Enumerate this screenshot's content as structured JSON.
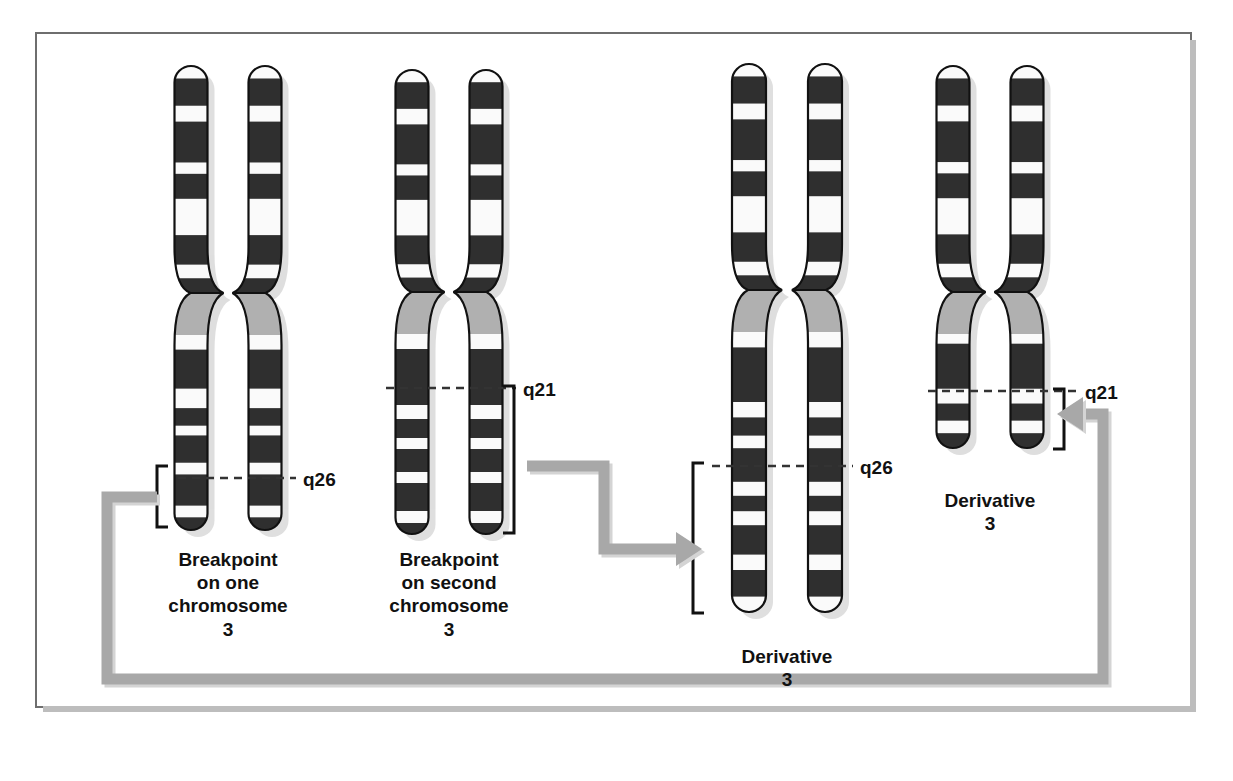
{
  "figure": {
    "background_color": "#ffffff",
    "border_color": "#6e6e6e",
    "shadow_color": "#bdbdbd"
  },
  "colors": {
    "band_dark": "#2f2f2f",
    "band_light": "#fafafa",
    "centromere_gray": "#b0b0b0",
    "outline": "#111111",
    "drop_shadow": "#c4c4c4",
    "connector_gray": "#a8a8a8",
    "bracket_black": "#111111",
    "dash_color": "#333333"
  },
  "groups": [
    {
      "id": "chromosome-pair-1",
      "caption": "Breakpoint\non one\nchromosome\n3",
      "caption_x": 228,
      "caption_y": 548,
      "band_label": "q26",
      "band_label_x": 303,
      "band_label_y": 468,
      "dash_y": 478,
      "dash_x1": 178,
      "dash_x2": 296,
      "bracket": {
        "x": 157,
        "y_top": 466,
        "y_bottom": 527
      },
      "center_x": 228,
      "top_y": 66,
      "bottom_y": 530,
      "centromere_y": 293,
      "chromatid_offset": 37,
      "width": 33,
      "p_bands": [
        [
          0.0,
          0.055,
          "light"
        ],
        [
          0.055,
          0.175,
          "dark"
        ],
        [
          0.175,
          0.245,
          "light"
        ],
        [
          0.245,
          0.425,
          "dark"
        ],
        [
          0.425,
          0.475,
          "light"
        ],
        [
          0.475,
          0.585,
          "dark"
        ],
        [
          0.585,
          0.745,
          "light"
        ],
        [
          0.745,
          0.875,
          "dark"
        ],
        [
          0.875,
          0.935,
          "light"
        ],
        [
          0.935,
          1.0,
          "dark"
        ]
      ],
      "q_bands": [
        [
          0.0,
          0.075,
          "light"
        ],
        [
          0.075,
          0.275,
          "dark"
        ],
        [
          0.275,
          0.375,
          "light"
        ],
        [
          0.375,
          0.465,
          "dark"
        ],
        [
          0.465,
          0.515,
          "light"
        ],
        [
          0.515,
          0.655,
          "dark"
        ],
        [
          0.655,
          0.715,
          "light"
        ],
        [
          0.715,
          0.875,
          "dark"
        ],
        [
          0.875,
          0.935,
          "light"
        ],
        [
          0.935,
          1.0,
          "dark"
        ]
      ]
    },
    {
      "id": "chromosome-pair-2",
      "caption": "Breakpoint\non second\nchromosome\n3",
      "caption_x": 449,
      "caption_y": 548,
      "band_label": "q21",
      "band_label_x": 523,
      "band_label_y": 378,
      "dash_y": 388,
      "dash_x1": 386,
      "dash_x2": 516,
      "bracket": {
        "x": 514,
        "y_top": 386,
        "y_bottom": 533
      },
      "center_x": 449,
      "top_y": 70,
      "bottom_y": 534,
      "centromere_y": 292,
      "chromatid_offset": 37,
      "width": 33,
      "p_bands": [
        [
          0.0,
          0.055,
          "light"
        ],
        [
          0.055,
          0.175,
          "dark"
        ],
        [
          0.175,
          0.245,
          "light"
        ],
        [
          0.245,
          0.425,
          "dark"
        ],
        [
          0.425,
          0.475,
          "light"
        ],
        [
          0.475,
          0.585,
          "dark"
        ],
        [
          0.585,
          0.745,
          "light"
        ],
        [
          0.745,
          0.875,
          "dark"
        ],
        [
          0.875,
          0.935,
          "light"
        ],
        [
          0.935,
          1.0,
          "dark"
        ]
      ],
      "q_bands": [
        [
          0.0,
          0.075,
          "light"
        ],
        [
          0.075,
          0.355,
          "dark"
        ],
        [
          0.355,
          0.425,
          "light"
        ],
        [
          0.425,
          0.52,
          "dark"
        ],
        [
          0.52,
          0.575,
          "light"
        ],
        [
          0.575,
          0.69,
          "dark"
        ],
        [
          0.69,
          0.745,
          "light"
        ],
        [
          0.745,
          0.885,
          "dark"
        ],
        [
          0.885,
          0.945,
          "light"
        ],
        [
          0.945,
          1.0,
          "dark"
        ]
      ]
    },
    {
      "id": "derivative-chromosome-3-long",
      "caption": "Derivative\n3",
      "caption_x": 787,
      "caption_y": 645,
      "band_label": "q26",
      "band_label_x": 860,
      "band_label_y": 456,
      "dash_y": 466,
      "dash_x1": 712,
      "dash_x2": 853,
      "bracket": {
        "x": 693,
        "y_top": 463,
        "y_bottom": 613
      },
      "center_x": 787,
      "top_y": 64,
      "bottom_y": 612,
      "centromere_y": 290,
      "chromatid_offset": 38,
      "width": 34,
      "p_bands": [
        [
          0.0,
          0.055,
          "light"
        ],
        [
          0.055,
          0.175,
          "dark"
        ],
        [
          0.175,
          0.245,
          "light"
        ],
        [
          0.245,
          0.425,
          "dark"
        ],
        [
          0.425,
          0.475,
          "light"
        ],
        [
          0.475,
          0.585,
          "dark"
        ],
        [
          0.585,
          0.745,
          "light"
        ],
        [
          0.745,
          0.875,
          "dark"
        ],
        [
          0.875,
          0.935,
          "light"
        ],
        [
          0.935,
          1.0,
          "dark"
        ]
      ],
      "q_bands": [
        [
          0.0,
          0.055,
          "light"
        ],
        [
          0.055,
          0.25,
          "dark"
        ],
        [
          0.25,
          0.305,
          "light"
        ],
        [
          0.305,
          0.37,
          "dark"
        ],
        [
          0.37,
          0.415,
          "light"
        ],
        [
          0.415,
          0.535,
          "dark"
        ],
        [
          0.535,
          0.585,
          "light"
        ],
        [
          0.585,
          0.64,
          "dark"
        ],
        [
          0.64,
          0.69,
          "light"
        ],
        [
          0.69,
          0.795,
          "dark"
        ],
        [
          0.795,
          0.85,
          "light"
        ],
        [
          0.85,
          0.945,
          "dark"
        ],
        [
          0.945,
          1.0,
          "light"
        ]
      ]
    },
    {
      "id": "derivative-chromosome-3-short",
      "caption": "Derivative\n3",
      "caption_x": 990,
      "caption_y": 489,
      "band_label": "q21",
      "band_label_x": 1085,
      "band_label_y": 381,
      "dash_y": 391,
      "dash_x1": 928,
      "dash_x2": 1078,
      "bracket": {
        "x": 1064,
        "y_top": 389,
        "y_bottom": 449
      },
      "center_x": 990,
      "top_y": 66,
      "bottom_y": 448,
      "centromere_y": 292,
      "chromatid_offset": 37,
      "width": 33,
      "p_bands": [
        [
          0.0,
          0.055,
          "light"
        ],
        [
          0.055,
          0.175,
          "dark"
        ],
        [
          0.175,
          0.245,
          "light"
        ],
        [
          0.245,
          0.425,
          "dark"
        ],
        [
          0.425,
          0.475,
          "light"
        ],
        [
          0.475,
          0.585,
          "dark"
        ],
        [
          0.585,
          0.745,
          "light"
        ],
        [
          0.745,
          0.875,
          "dark"
        ],
        [
          0.875,
          0.935,
          "light"
        ],
        [
          0.935,
          1.0,
          "dark"
        ]
      ],
      "q_bands": [
        [
          0.0,
          0.085,
          "light"
        ],
        [
          0.085,
          0.48,
          "dark"
        ],
        [
          0.48,
          0.61,
          "light"
        ],
        [
          0.61,
          0.76,
          "dark"
        ],
        [
          0.76,
          0.87,
          "light"
        ],
        [
          0.87,
          1.0,
          "dark"
        ]
      ]
    }
  ],
  "connectors": [
    {
      "id": "connector-step-middle",
      "description": "stepped gray arrow from second pair bracket to third derivative bracket",
      "points": "527,466 604,466 604,549 676,549",
      "arrow": "right"
    },
    {
      "id": "connector-bottom-loop",
      "description": "long gray arrow from first pair bracket down, across the bottom, up to the fourth derivative bracket",
      "points": "157,497 107,497 107,679 1103,679 1103,414 1083,414",
      "arrow": "left"
    }
  ]
}
